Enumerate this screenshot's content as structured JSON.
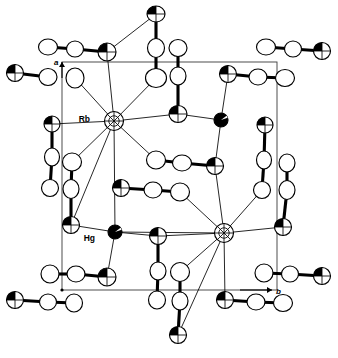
{
  "figure": {
    "type": "ortep-thermal-ellipsoid-plot",
    "width": 338,
    "height": 358,
    "background_color": "#ffffff",
    "line_color": "#000000",
    "cell_edge_color": "#3a3a3a"
  },
  "labels": {
    "cation_label": "Rb",
    "metal_label": "Hg",
    "axis_a": "a",
    "axis_b": "b"
  },
  "unit_cell": {
    "left": 62,
    "top": 62,
    "right": 277,
    "bottom": 290,
    "origin_x": 62,
    "origin_y": 290
  },
  "axes": [
    {
      "name": "a",
      "label": "a",
      "from_x": 62,
      "from_y": 78,
      "to_x": 62,
      "to_y": 62,
      "label_x": 54,
      "label_y": 65,
      "direction": "up"
    },
    {
      "name": "b",
      "label": "b",
      "from_x": 240,
      "from_y": 290,
      "to_x": 272,
      "to_y": 290,
      "label_x": 276,
      "label_y": 294,
      "direction": "right"
    }
  ],
  "atom_styles": {
    "open": "white ellipse with black outline",
    "shaded": "ellipse with black wedge octant shading",
    "filled": "solid black ellipse"
  },
  "atoms": [
    {
      "id": "Rb1",
      "x": 114,
      "y": 121,
      "rx": 9.5,
      "ry": 9.5,
      "rot": 0,
      "style": "shaded-cross",
      "label": "Rb",
      "label_x": 90,
      "label_y": 122
    },
    {
      "id": "Rb2",
      "x": 224,
      "y": 233,
      "rx": 9.5,
      "ry": 9.5,
      "rot": 0,
      "style": "shaded-cross",
      "label": "",
      "label_x": 0,
      "label_y": 0
    },
    {
      "id": "Hg1",
      "x": 115,
      "y": 232,
      "rx": 7.0,
      "ry": 7.0,
      "rot": 0,
      "style": "filled",
      "label": "Hg",
      "label_x": 95,
      "label_y": 241
    },
    {
      "id": "Hg2",
      "x": 221,
      "y": 120,
      "rx": 7.0,
      "ry": 7.0,
      "rot": 0,
      "style": "filled",
      "label": "",
      "label_x": 0,
      "label_y": 0
    },
    {
      "id": "A01",
      "x": 156,
      "y": 14,
      "rx": 9.0,
      "ry": 8.0,
      "rot": 0,
      "style": "shaded"
    },
    {
      "id": "A02",
      "x": 156,
      "y": 48,
      "rx": 8.5,
      "ry": 9.5,
      "rot": 0,
      "style": "open"
    },
    {
      "id": "A03",
      "x": 156,
      "y": 78,
      "rx": 10.5,
      "ry": 9.5,
      "rot": 0,
      "style": "open"
    },
    {
      "id": "A04",
      "x": 178,
      "y": 48,
      "rx": 9.0,
      "ry": 8.5,
      "rot": 0,
      "style": "open"
    },
    {
      "id": "A05",
      "x": 178,
      "y": 76,
      "rx": 8.0,
      "ry": 9.0,
      "rot": 0,
      "style": "open"
    },
    {
      "id": "A06",
      "x": 178,
      "y": 114,
      "rx": 9.0,
      "ry": 8.5,
      "rot": 0,
      "style": "shaded"
    },
    {
      "id": "B01",
      "x": 48,
      "y": 47,
      "rx": 9.5,
      "ry": 8.0,
      "rot": 0,
      "style": "open"
    },
    {
      "id": "B02",
      "x": 75,
      "y": 49,
      "rx": 8.5,
      "ry": 8.0,
      "rot": 0,
      "style": "open"
    },
    {
      "id": "B03",
      "x": 107,
      "y": 52,
      "rx": 9.0,
      "ry": 9.0,
      "rot": 0,
      "style": "shaded"
    },
    {
      "id": "B04",
      "x": 15,
      "y": 73,
      "rx": 8.5,
      "ry": 8.5,
      "rot": 0,
      "style": "shaded"
    },
    {
      "id": "B05",
      "x": 48,
      "y": 77,
      "rx": 9.0,
      "ry": 8.5,
      "rot": 0,
      "style": "open"
    },
    {
      "id": "B06",
      "x": 75,
      "y": 78,
      "rx": 9.0,
      "ry": 10.0,
      "rot": 0,
      "style": "open"
    },
    {
      "id": "C01",
      "x": 266,
      "y": 47,
      "rx": 9.5,
      "ry": 8.0,
      "rot": 0,
      "style": "open"
    },
    {
      "id": "C02",
      "x": 293,
      "y": 49,
      "rx": 8.5,
      "ry": 8.0,
      "rot": 0,
      "style": "open"
    },
    {
      "id": "C03",
      "x": 322,
      "y": 51,
      "rx": 8.5,
      "ry": 8.5,
      "rot": 0,
      "style": "shaded"
    },
    {
      "id": "C04",
      "x": 228,
      "y": 74,
      "rx": 8.5,
      "ry": 8.5,
      "rot": 0,
      "style": "shaded"
    },
    {
      "id": "C05",
      "x": 258,
      "y": 77,
      "rx": 9.0,
      "ry": 8.0,
      "rot": 0,
      "style": "open"
    },
    {
      "id": "C06",
      "x": 285,
      "y": 78,
      "rx": 9.5,
      "ry": 8.5,
      "rot": 0,
      "style": "open"
    },
    {
      "id": "D01",
      "x": 52,
      "y": 124,
      "rx": 8.0,
      "ry": 8.0,
      "rot": 0,
      "style": "shaded"
    },
    {
      "id": "D02",
      "x": 52,
      "y": 157,
      "rx": 7.5,
      "ry": 9.0,
      "rot": 0,
      "style": "open"
    },
    {
      "id": "D03",
      "x": 50,
      "y": 188,
      "rx": 8.5,
      "ry": 8.5,
      "rot": 0,
      "style": "open"
    },
    {
      "id": "E01",
      "x": 72,
      "y": 162,
      "rx": 9.5,
      "ry": 9.0,
      "rot": 0,
      "style": "open"
    },
    {
      "id": "E02",
      "x": 71,
      "y": 189,
      "rx": 8.0,
      "ry": 9.5,
      "rot": 0,
      "style": "open"
    },
    {
      "id": "E03",
      "x": 71,
      "y": 225,
      "rx": 8.5,
      "ry": 8.5,
      "rot": 0,
      "style": "shaded"
    },
    {
      "id": "F01",
      "x": 265,
      "y": 125,
      "rx": 8.0,
      "ry": 8.0,
      "rot": 0,
      "style": "shaded"
    },
    {
      "id": "F02",
      "x": 264,
      "y": 160,
      "rx": 7.5,
      "ry": 9.0,
      "rot": 0,
      "style": "open"
    },
    {
      "id": "F03",
      "x": 262,
      "y": 190,
      "rx": 8.5,
      "ry": 8.5,
      "rot": 0,
      "style": "open"
    },
    {
      "id": "G01",
      "x": 287,
      "y": 163,
      "rx": 8.0,
      "ry": 9.0,
      "rot": 0,
      "style": "open"
    },
    {
      "id": "G02",
      "x": 287,
      "y": 190,
      "rx": 8.0,
      "ry": 9.5,
      "rot": 0,
      "style": "open"
    },
    {
      "id": "G03",
      "x": 283,
      "y": 227,
      "rx": 8.5,
      "ry": 8.5,
      "rot": 0,
      "style": "shaded"
    },
    {
      "id": "H01",
      "x": 156,
      "y": 160,
      "rx": 9.5,
      "ry": 9.0,
      "rot": 0,
      "style": "open"
    },
    {
      "id": "H02",
      "x": 182,
      "y": 163,
      "rx": 9.5,
      "ry": 8.0,
      "rot": 0,
      "style": "open"
    },
    {
      "id": "H03",
      "x": 215,
      "y": 166,
      "rx": 8.5,
      "ry": 8.5,
      "rot": 0,
      "style": "shaded"
    },
    {
      "id": "I01",
      "x": 121,
      "y": 188,
      "rx": 8.5,
      "ry": 8.5,
      "rot": 0,
      "style": "shaded"
    },
    {
      "id": "I02",
      "x": 153,
      "y": 190,
      "rx": 9.0,
      "ry": 8.0,
      "rot": 0,
      "style": "open"
    },
    {
      "id": "I03",
      "x": 180,
      "y": 192,
      "rx": 9.5,
      "ry": 9.0,
      "rot": 0,
      "style": "open"
    },
    {
      "id": "J01",
      "x": 158,
      "y": 236,
      "rx": 8.5,
      "ry": 8.5,
      "rot": 0,
      "style": "shaded"
    },
    {
      "id": "J02",
      "x": 158,
      "y": 271,
      "rx": 8.0,
      "ry": 9.0,
      "rot": 0,
      "style": "open"
    },
    {
      "id": "J03",
      "x": 157,
      "y": 300,
      "rx": 8.5,
      "ry": 9.0,
      "rot": 0,
      "style": "open"
    },
    {
      "id": "K01",
      "x": 180,
      "y": 272,
      "rx": 9.5,
      "ry": 9.5,
      "rot": 0,
      "style": "open"
    },
    {
      "id": "K02",
      "x": 180,
      "y": 301,
      "rx": 8.0,
      "ry": 9.0,
      "rot": 0,
      "style": "open"
    },
    {
      "id": "K03",
      "x": 178,
      "y": 335,
      "rx": 8.5,
      "ry": 8.5,
      "rot": 0,
      "style": "shaded"
    },
    {
      "id": "L01",
      "x": 50,
      "y": 274,
      "rx": 9.0,
      "ry": 9.0,
      "rot": 0,
      "style": "open"
    },
    {
      "id": "L02",
      "x": 76,
      "y": 274,
      "rx": 9.0,
      "ry": 8.0,
      "rot": 0,
      "style": "open"
    },
    {
      "id": "L03",
      "x": 107,
      "y": 277,
      "rx": 9.0,
      "ry": 9.0,
      "rot": 0,
      "style": "shaded"
    },
    {
      "id": "L04",
      "x": 15,
      "y": 300,
      "rx": 8.5,
      "ry": 8.5,
      "rot": 0,
      "style": "shaded"
    },
    {
      "id": "L05",
      "x": 48,
      "y": 302,
      "rx": 8.5,
      "ry": 8.0,
      "rot": 0,
      "style": "open"
    },
    {
      "id": "L06",
      "x": 74,
      "y": 303,
      "rx": 8.5,
      "ry": 9.0,
      "rot": 0,
      "style": "open"
    },
    {
      "id": "M01",
      "x": 264,
      "y": 273,
      "rx": 9.0,
      "ry": 9.0,
      "rot": 0,
      "style": "open"
    },
    {
      "id": "M02",
      "x": 290,
      "y": 274,
      "rx": 8.5,
      "ry": 8.0,
      "rot": 0,
      "style": "open"
    },
    {
      "id": "M03",
      "x": 322,
      "y": 276,
      "rx": 8.5,
      "ry": 8.5,
      "rot": 0,
      "style": "shaded"
    },
    {
      "id": "M04",
      "x": 225,
      "y": 300,
      "rx": 8.5,
      "ry": 8.5,
      "rot": 0,
      "style": "shaded"
    },
    {
      "id": "M05",
      "x": 256,
      "y": 302,
      "rx": 9.0,
      "ry": 8.0,
      "rot": 0,
      "style": "open"
    },
    {
      "id": "M06",
      "x": 283,
      "y": 303,
      "rx": 9.5,
      "ry": 8.5,
      "rot": 0,
      "style": "open"
    }
  ],
  "bonds_thick": [
    [
      "B01",
      "B02"
    ],
    [
      "B02",
      "B03"
    ],
    [
      "B04",
      "B05"
    ],
    [
      "C01",
      "C02"
    ],
    [
      "C02",
      "C03"
    ],
    [
      "C04",
      "C05"
    ],
    [
      "C05",
      "C06"
    ],
    [
      "A01",
      "A02"
    ],
    [
      "A02",
      "A03"
    ],
    [
      "A04",
      "A05"
    ],
    [
      "A05",
      "A06"
    ],
    [
      "D01",
      "D02"
    ],
    [
      "D02",
      "D03"
    ],
    [
      "E01",
      "E02"
    ],
    [
      "E02",
      "E03"
    ],
    [
      "F01",
      "F02"
    ],
    [
      "F02",
      "F03"
    ],
    [
      "G01",
      "G02"
    ],
    [
      "G02",
      "G03"
    ],
    [
      "H01",
      "H02"
    ],
    [
      "H02",
      "H03"
    ],
    [
      "I01",
      "I02"
    ],
    [
      "I02",
      "I03"
    ],
    [
      "J01",
      "J02"
    ],
    [
      "J02",
      "J03"
    ],
    [
      "K01",
      "K02"
    ],
    [
      "K02",
      "K03"
    ],
    [
      "L01",
      "L02"
    ],
    [
      "L02",
      "L03"
    ],
    [
      "L04",
      "L05"
    ],
    [
      "L05",
      "L06"
    ],
    [
      "M01",
      "M02"
    ],
    [
      "M02",
      "M03"
    ],
    [
      "M04",
      "M05"
    ],
    [
      "M05",
      "M06"
    ]
  ],
  "bonds_thin": [
    [
      "Rb1",
      "B03"
    ],
    [
      "Rb1",
      "B06"
    ],
    [
      "Rb1",
      "A03"
    ],
    [
      "Rb1",
      "D01"
    ],
    [
      "Rb1",
      "A06"
    ],
    [
      "Rb1",
      "E01"
    ],
    [
      "Rb1",
      "H01"
    ],
    [
      "Rb1",
      "E03"
    ],
    [
      "Rb1",
      "Hg1"
    ],
    [
      "A06",
      "Hg2"
    ],
    [
      "Hg2",
      "C04"
    ],
    [
      "Hg2",
      "H03"
    ],
    [
      "Rb2",
      "H03"
    ],
    [
      "Rb2",
      "G03"
    ],
    [
      "Rb2",
      "F03"
    ],
    [
      "Rb2",
      "I03"
    ],
    [
      "Rb2",
      "J01"
    ],
    [
      "Rb2",
      "K01"
    ],
    [
      "Rb2",
      "K03"
    ],
    [
      "Rb2",
      "M04"
    ],
    [
      "Rb2",
      "Hg1"
    ],
    [
      "Hg1",
      "E03"
    ],
    [
      "Hg1",
      "J01"
    ],
    [
      "Hg1",
      "L03"
    ],
    [
      "B03",
      "A01"
    ]
  ],
  "element_key": {
    "open_ellipse": "light atom (C / N)",
    "shaded_ellipse": "S donor atom",
    "filled_ellipse": "Hg",
    "cross_hatched": "Rb"
  }
}
